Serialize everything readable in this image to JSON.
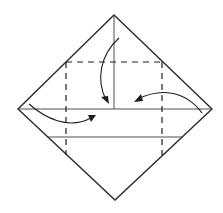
{
  "diagram": {
    "elements": {
      "outline": "diamond (square rotated 45°)",
      "creases": [
        "vertical-center-crease-upper-half",
        "horizontal-center-crease",
        "lower-horizontal-crease"
      ],
      "fold_lines": [
        "top-dashed-fold-line",
        "left-dashed-fold-line",
        "right-dashed-fold-line"
      ],
      "arrows": [
        {
          "name": "top-fold-arrow",
          "direction": "down, toward center"
        },
        {
          "name": "right-fold-arrow",
          "direction": "left, toward center"
        },
        {
          "name": "left-fold-arrow",
          "direction": "right, toward center"
        }
      ]
    },
    "colors": {
      "line": "#1e1e1e",
      "background": "#ffffff"
    }
  }
}
